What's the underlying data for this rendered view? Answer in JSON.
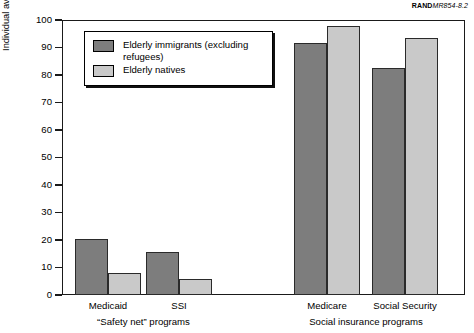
{
  "source_id": {
    "bold_part": "RAND",
    "italic_part": "MR854-8.2"
  },
  "chart_data": {
    "type": "bar",
    "title": "",
    "xlabel": "",
    "ylabel": "Individual average monthly probability of receiving benefits, 1990–1993 (percent)",
    "ylim": [
      0,
      100
    ],
    "ytick_values": [
      0,
      10,
      20,
      30,
      40,
      50,
      60,
      70,
      80,
      90,
      100
    ],
    "ytick_labels": [
      "0",
      "10",
      "20",
      "30",
      "40",
      "50",
      "60",
      "70",
      "80",
      "90",
      "100"
    ],
    "grid": false,
    "legend_position": "upper left inside plot",
    "categories": [
      "Medicaid",
      "SSI",
      "Medicare",
      "Social Security"
    ],
    "group_labels": [
      "“Safety net” programs",
      "Social insurance programs"
    ],
    "groups": [
      {
        "label": "“Safety net” programs",
        "categories": [
          "Medicaid",
          "SSI"
        ]
      },
      {
        "label": "Social insurance programs",
        "categories": [
          "Medicare",
          "Social Security"
        ]
      }
    ],
    "series": [
      {
        "name": "Elderly immigrants (excluding refugees)",
        "color": "#7d7d7d",
        "values": [
          20.5,
          15.5,
          91.5,
          82.5
        ]
      },
      {
        "name": "Elderly natives",
        "color": "#c9c9c9",
        "values": [
          8.0,
          5.8,
          98.0,
          93.5
        ]
      }
    ]
  },
  "legend": {
    "items": [
      {
        "label": "Elderly immigrants (excluding\nrefugees)",
        "color": "#7d7d7d"
      },
      {
        "label": "Elderly natives",
        "color": "#c9c9c9"
      }
    ]
  },
  "colors": {
    "immigrants": "#7d7d7d",
    "natives": "#c9c9c9",
    "axis": "#1a1a1a",
    "background": "#ffffff"
  }
}
